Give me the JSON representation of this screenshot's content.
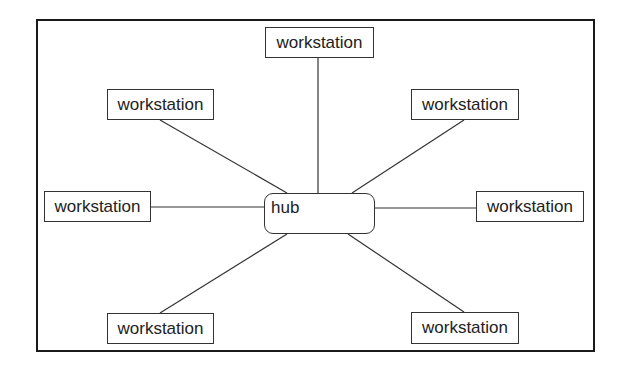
{
  "diagram": {
    "type": "star-topology",
    "colors": {
      "line": "#333333",
      "frame": "#1a1a1a",
      "background": "#ffffff"
    },
    "hub": {
      "label": "hub",
      "x": 264,
      "y": 193,
      "w": 111,
      "h": 41
    },
    "workstations": [
      {
        "id": "top",
        "label": "workstation",
        "x": 265,
        "y": 27,
        "w": 109,
        "h": 31,
        "anchor": [
          318,
          58
        ],
        "hub_anchor": [
          318,
          193
        ]
      },
      {
        "id": "upper-left",
        "label": "workstation",
        "x": 107,
        "y": 89,
        "w": 107,
        "h": 31,
        "anchor": [
          160,
          120
        ],
        "hub_anchor": [
          287,
          193
        ]
      },
      {
        "id": "upper-right",
        "label": "workstation",
        "x": 411,
        "y": 89,
        "w": 108,
        "h": 31,
        "anchor": [
          464,
          120
        ],
        "hub_anchor": [
          352,
          193
        ]
      },
      {
        "id": "left",
        "label": "workstation",
        "x": 44,
        "y": 191,
        "w": 107,
        "h": 31,
        "anchor": [
          151,
          207
        ],
        "hub_anchor": [
          264,
          207
        ]
      },
      {
        "id": "right",
        "label": "workstation",
        "x": 476,
        "y": 191,
        "w": 108,
        "h": 31,
        "anchor": [
          476,
          208
        ],
        "hub_anchor": [
          375,
          208
        ]
      },
      {
        "id": "lower-left",
        "label": "workstation",
        "x": 107,
        "y": 313,
        "w": 107,
        "h": 31,
        "anchor": [
          160,
          313
        ],
        "hub_anchor": [
          287,
          234
        ]
      },
      {
        "id": "lower-right",
        "label": "workstation",
        "x": 411,
        "y": 312,
        "w": 108,
        "h": 32,
        "anchor": [
          464,
          312
        ],
        "hub_anchor": [
          348,
          234
        ]
      }
    ]
  }
}
